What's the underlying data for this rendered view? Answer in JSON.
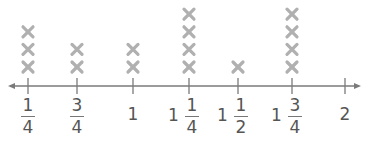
{
  "chart_data": {
    "type": "line_plot",
    "title": "",
    "xlabel": "",
    "ylabel": "",
    "marker": "X",
    "categories": [
      "1/4",
      "3/4",
      "1",
      "1 1/4",
      "1 1/2",
      "1 3/4",
      "2"
    ],
    "x": [
      0.25,
      0.75,
      1.0,
      1.25,
      1.5,
      1.75,
      2.0
    ],
    "values": [
      3,
      2,
      2,
      4,
      1,
      4,
      0
    ],
    "xlim": [
      0.25,
      2.0
    ],
    "grid": false,
    "legend": null,
    "axis": {
      "arrows": "both"
    }
  },
  "colors": {
    "axis": "#7a7a7a",
    "marker": "#b0b0b0",
    "text": "#555555"
  },
  "ticks": [
    {
      "x": 28,
      "whole": "",
      "num": "1",
      "den": "4"
    },
    {
      "x": 77,
      "whole": "",
      "num": "3",
      "den": "4"
    },
    {
      "x": 133,
      "whole": "1",
      "num": "",
      "den": ""
    },
    {
      "x": 189,
      "whole": "1",
      "num": "1",
      "den": "4"
    },
    {
      "x": 238,
      "whole": "1",
      "num": "1",
      "den": "2"
    },
    {
      "x": 292,
      "whole": "1",
      "num": "3",
      "den": "4"
    },
    {
      "x": 345,
      "whole": "2",
      "num": "",
      "den": ""
    }
  ]
}
